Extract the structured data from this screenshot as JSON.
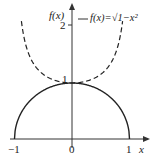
{
  "chart_data": {
    "type": "line",
    "title": "",
    "xlabel": "x",
    "ylabel": "f(x)",
    "xlim": [
      -1,
      1
    ],
    "ylim": [
      0,
      2.2
    ],
    "x_ticks": [
      "-1",
      "0",
      "1"
    ],
    "y_ticks": [
      "1",
      "2"
    ],
    "grid": false,
    "legend": {
      "position": "top-right",
      "entries": [
        "f(x)=√1−x²"
      ]
    },
    "series": [
      {
        "name": "f(x)=√(1−x²)",
        "style": "solid",
        "x": [
          -1,
          -0.75,
          -0.5,
          -0.25,
          0,
          0.25,
          0.5,
          0.75,
          1
        ],
        "y": [
          0,
          0.66,
          0.87,
          0.97,
          1,
          0.97,
          0.87,
          0.66,
          0
        ]
      },
      {
        "name": "1/√(1−x²)",
        "style": "dashed",
        "x": [
          -0.88,
          -0.75,
          -0.5,
          -0.25,
          0,
          0.25,
          0.5,
          0.75,
          0.88
        ],
        "y": [
          2.1,
          1.51,
          1.15,
          1.03,
          1,
          1.03,
          1.15,
          1.51,
          2.1
        ]
      }
    ]
  },
  "labels": {
    "y_axis": "f(x)",
    "x_axis": "x",
    "tick_neg1": "−1",
    "tick_0": "0",
    "tick_1": "1",
    "ytick_1": "1",
    "ytick_2": "2",
    "legend": "f(x)=√1−x²"
  }
}
